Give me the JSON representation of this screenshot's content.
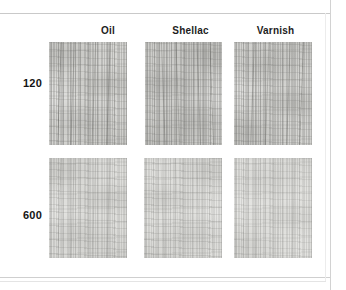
{
  "figure": {
    "width": 346,
    "height": 290,
    "background_color": "#ffffff",
    "rule_color": "#c9c9c9",
    "border_color": "#d2d2d2"
  },
  "grid": {
    "column_headers": [
      {
        "label": "Oil",
        "x": 88,
        "y": 25,
        "width": 40
      },
      {
        "label": "Shellac",
        "x": 168,
        "y": 25,
        "width": 50
      },
      {
        "label": "Varnish",
        "x": 252,
        "y": 25,
        "width": 50
      }
    ],
    "row_headers": [
      {
        "label": "120",
        "x": 12,
        "y": 77,
        "width": 30
      },
      {
        "label": "600",
        "x": 12,
        "y": 209,
        "width": 30
      }
    ],
    "panels": [
      {
        "name": "sample-120-oil",
        "row": "120",
        "column": "Oil",
        "x": 49,
        "y": 42,
        "width": 78,
        "height": 103,
        "base_color": "#d6d6d3",
        "texture": "coarse-vertical-grain",
        "grain_direction": "vertical"
      },
      {
        "name": "sample-120-shellac",
        "row": "120",
        "column": "Shellac",
        "x": 145,
        "y": 42,
        "width": 77,
        "height": 103,
        "base_color": "#cececb",
        "texture": "coarse-vertical-grain",
        "grain_direction": "vertical"
      },
      {
        "name": "sample-120-varnish",
        "row": "120",
        "column": "Varnish",
        "x": 234,
        "y": 42,
        "width": 78,
        "height": 103,
        "base_color": "#d4d4d1",
        "texture": "coarse-vertical-grain",
        "grain_direction": "vertical"
      },
      {
        "name": "sample-600-oil",
        "row": "600",
        "column": "Oil",
        "x": 49,
        "y": 158,
        "width": 78,
        "height": 100,
        "base_color": "#dedeDB",
        "texture": "fine-sanded-grain",
        "grain_direction": "vertical"
      },
      {
        "name": "sample-600-shellac",
        "row": "600",
        "column": "Shellac",
        "x": 144,
        "y": 158,
        "width": 78,
        "height": 100,
        "base_color": "#e0e0dd",
        "texture": "fine-sanded-grain",
        "grain_direction": "vertical"
      },
      {
        "name": "sample-600-varnish",
        "row": "600",
        "column": "Varnish",
        "x": 234,
        "y": 158,
        "width": 78,
        "height": 100,
        "base_color": "#e2e2df",
        "texture": "fine-sanded-grain",
        "grain_direction": "vertical"
      }
    ]
  }
}
